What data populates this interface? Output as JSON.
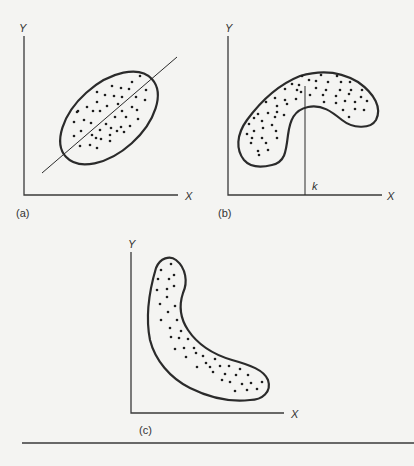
{
  "figure": {
    "panels": [
      {
        "id": "a",
        "caption": "(a)",
        "x_label": "X",
        "y_label": "Y",
        "shape": "ellipse",
        "description": "Elliptical scatter of points with a straight regression line through it (linear positive relationship)"
      },
      {
        "id": "b",
        "caption": "(b)",
        "x_label": "X",
        "y_label": "Y",
        "marker_label": "k",
        "shape": "curved-arch",
        "description": "Curved (inverted-U) scatter of points with a vertical line at x = k"
      },
      {
        "id": "c",
        "caption": "(c)",
        "x_label": "X",
        "y_label": "Y",
        "shape": "curved-decreasing",
        "description": "Curved decreasing (L-shaped) scatter of points"
      }
    ],
    "colors": {
      "background": "#f4f4f2",
      "stroke": "#2b2b2b",
      "axis": "#3a3a3a",
      "text": "#333333"
    }
  }
}
